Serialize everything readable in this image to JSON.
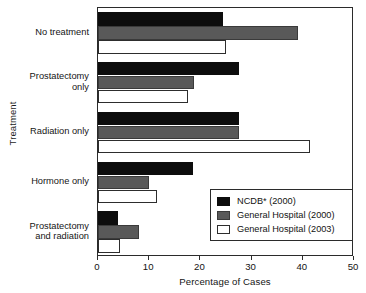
{
  "chart_data": {
    "type": "bar",
    "orientation": "horizontal",
    "title": "",
    "xlabel": "Percentage of Cases",
    "ylabel": "Treatment",
    "xlim": [
      0,
      50
    ],
    "xticks": [
      0,
      10,
      20,
      30,
      40,
      50
    ],
    "grid": false,
    "legend_position": "inside-bottom-right",
    "categories": [
      "No treatment",
      "Prostatectomy\nonly",
      "Radiation only",
      "Hormone only",
      "Prostatectomy\nand radiation"
    ],
    "series": [
      {
        "name": "NCDB* (2000)",
        "color": "#0d0d0d",
        "values": [
          24.5,
          27.5,
          27.5,
          18.5,
          4.0
        ]
      },
      {
        "name": "General Hospital (2000)",
        "color": "#595959",
        "values": [
          39.0,
          18.8,
          27.5,
          10.0,
          8.0
        ]
      },
      {
        "name": "General Hospital (2003)",
        "color": "#ffffff",
        "values": [
          25.0,
          17.5,
          41.5,
          11.5,
          4.2
        ]
      }
    ]
  },
  "axis": {
    "x_title": "Percentage of Cases",
    "y_title": "Treatment",
    "x_tick_labels": [
      "0",
      "10",
      "20",
      "30",
      "40",
      "50"
    ]
  },
  "legend": {
    "entries": [
      {
        "label": "NCDB* (2000)",
        "swatch": "sw-ncdb"
      },
      {
        "label": "General Hospital (2000)",
        "swatch": "sw-gh2000"
      },
      {
        "label": "General Hospital (2003)",
        "swatch": "sw-gh2003"
      }
    ]
  }
}
